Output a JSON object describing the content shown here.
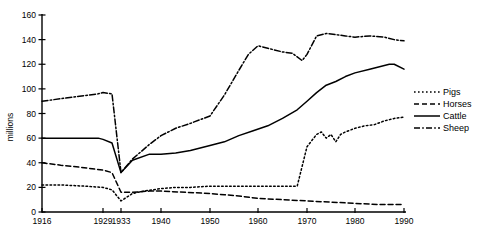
{
  "chart_data": {
    "type": "line",
    "title": "",
    "xlabel": "",
    "ylabel": "millions",
    "xlim": [
      1916,
      1990
    ],
    "ylim": [
      0,
      160
    ],
    "grid": false,
    "legend_position": "right",
    "x_ticks": [
      1916,
      1929,
      1933,
      1940,
      1950,
      1960,
      1970,
      1980,
      1990
    ],
    "x_tick_labels": [
      "1916",
      "1929",
      "1933",
      "1940",
      "1950",
      "1960",
      "1970",
      "1980",
      "1990"
    ],
    "y_ticks": [
      0,
      20,
      40,
      60,
      80,
      100,
      120,
      140,
      160
    ],
    "y_tick_labels": [
      "0",
      "20",
      "40",
      "60",
      "80",
      "100",
      "120",
      "140",
      "160"
    ],
    "series": [
      {
        "name": "Pigs",
        "style": "dotted",
        "dash": "1.6,2.4",
        "x": [
          1916,
          1920,
          1925,
          1929,
          1931,
          1933,
          1935,
          1937,
          1940,
          1943,
          1946,
          1950,
          1953,
          1956,
          1959,
          1962,
          1965,
          1968,
          1970,
          1971,
          1972,
          1973,
          1974,
          1975,
          1976,
          1977,
          1978,
          1980,
          1982,
          1984,
          1986,
          1988,
          1990
        ],
        "values": [
          22,
          22,
          21,
          20,
          18,
          9,
          15,
          17,
          19,
          20,
          20,
          21,
          21,
          21,
          21,
          21,
          21,
          21,
          53,
          58,
          63,
          65,
          60,
          63,
          57,
          63,
          65,
          68,
          70,
          71,
          74,
          76,
          77
        ]
      },
      {
        "name": "Horses",
        "style": "dashed",
        "dash": "5,3",
        "x": [
          1916,
          1920,
          1925,
          1929,
          1931,
          1933,
          1935,
          1938,
          1940,
          1945,
          1950,
          1953,
          1956,
          1960,
          1965,
          1970,
          1975,
          1980,
          1985,
          1988,
          1990
        ],
        "values": [
          40,
          38,
          36,
          34,
          32,
          16,
          16,
          17,
          17,
          16,
          15,
          14,
          13,
          11,
          10,
          9,
          8,
          7,
          6,
          6,
          6
        ]
      },
      {
        "name": "Cattle",
        "style": "solid",
        "dash": "",
        "x": [
          1916,
          1922,
          1928,
          1929,
          1931,
          1933,
          1935,
          1938,
          1940,
          1943,
          1946,
          1950,
          1953,
          1956,
          1959,
          1962,
          1965,
          1968,
          1970,
          1972,
          1974,
          1976,
          1978,
          1980,
          1983,
          1985,
          1987,
          1988,
          1990
        ],
        "values": [
          60,
          60,
          60,
          59,
          56,
          32,
          42,
          47,
          47,
          48,
          50,
          54,
          57,
          62,
          66,
          70,
          76,
          83,
          90,
          97,
          103,
          106,
          110,
          113,
          116,
          118,
          120,
          120,
          116
        ]
      },
      {
        "name": "Sheep",
        "style": "dashdot",
        "dash": "6,2.2,1.6,2.2",
        "x": [
          1916,
          1920,
          1924,
          1928,
          1929,
          1931,
          1933,
          1935,
          1938,
          1940,
          1943,
          1946,
          1950,
          1953,
          1956,
          1958,
          1960,
          1962,
          1965,
          1967,
          1969,
          1970,
          1972,
          1974,
          1976,
          1978,
          1980,
          1983,
          1986,
          1988,
          1990
        ],
        "values": [
          90,
          92,
          94,
          96,
          97,
          96,
          32,
          43,
          55,
          62,
          68,
          72,
          78,
          95,
          115,
          128,
          135,
          133,
          130,
          129,
          123,
          128,
          143,
          145,
          144,
          143,
          142,
          143,
          142,
          140,
          139
        ]
      }
    ]
  },
  "legend": {
    "items": [
      {
        "label": "Pigs"
      },
      {
        "label": "Horses"
      },
      {
        "label": "Cattle"
      },
      {
        "label": "Sheep"
      }
    ]
  },
  "axes": {
    "y_title": "millions"
  }
}
